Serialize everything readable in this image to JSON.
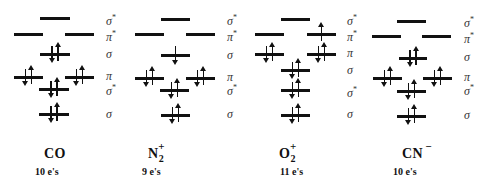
{
  "molecules": [
    {
      "name": "CO",
      "subscript": "",
      "charge": "",
      "electron_count": "10 e's",
      "orbital_labels": [
        {
          "symbol": "σ",
          "star": "*",
          "y": 12
        },
        {
          "symbol": "π",
          "star": "*",
          "y": 28
        },
        {
          "symbol": "σ",
          "star": "",
          "y": 48
        },
        {
          "symbol": "π",
          "star": "",
          "y": 70
        },
        {
          "symbol": "σ",
          "star": "*",
          "y": 82
        },
        {
          "symbol": "σ",
          "star": "",
          "y": 108
        }
      ],
      "levels": [
        {
          "orbital": "σ*",
          "x": 40,
          "y": 17,
          "w": 30,
          "electrons": 0
        },
        {
          "orbital": "π*",
          "x": 14,
          "y": 33,
          "w": 29,
          "electrons": 0
        },
        {
          "orbital": "π*",
          "x": 65,
          "y": 33,
          "w": 29,
          "electrons": 0
        },
        {
          "orbital": "σ",
          "x": 40,
          "y": 53,
          "w": 30,
          "electrons": 2
        },
        {
          "orbital": "π",
          "x": 14,
          "y": 76,
          "w": 29,
          "electrons": 2
        },
        {
          "orbital": "π",
          "x": 65,
          "y": 76,
          "w": 29,
          "electrons": 2
        },
        {
          "orbital": "σ*",
          "x": 39,
          "y": 88,
          "w": 30,
          "electrons": 2
        },
        {
          "orbital": "σ",
          "x": 39,
          "y": 113,
          "w": 30,
          "electrons": 2
        }
      ],
      "label_x": 106,
      "name_x": 44,
      "name_y": 146,
      "count_x": 35,
      "count_y": 166
    },
    {
      "name": "N",
      "subscript": "2",
      "charge": "+",
      "electron_count": "9 e's",
      "orbital_labels": [
        {
          "symbol": "σ",
          "star": "*",
          "y": 12
        },
        {
          "symbol": "π",
          "star": "*",
          "y": 28
        },
        {
          "symbol": "σ",
          "star": "",
          "y": 49
        },
        {
          "symbol": "π",
          "star": "",
          "y": 71
        },
        {
          "symbol": "σ",
          "star": "*",
          "y": 82
        },
        {
          "symbol": "σ",
          "star": "",
          "y": 108
        }
      ],
      "levels": [
        {
          "orbital": "σ*",
          "x": 161,
          "y": 18,
          "w": 29,
          "electrons": 0
        },
        {
          "orbital": "π*",
          "x": 135,
          "y": 33,
          "w": 29,
          "electrons": 0
        },
        {
          "orbital": "π*",
          "x": 186,
          "y": 33,
          "w": 29,
          "electrons": 0
        },
        {
          "orbital": "σ",
          "x": 161,
          "y": 54,
          "w": 29,
          "electrons": 1,
          "spin": "down"
        },
        {
          "orbital": "π",
          "x": 135,
          "y": 77,
          "w": 29,
          "electrons": 2
        },
        {
          "orbital": "π",
          "x": 186,
          "y": 77,
          "w": 29,
          "electrons": 2
        },
        {
          "orbital": "σ*",
          "x": 160,
          "y": 89,
          "w": 29,
          "electrons": 2
        },
        {
          "orbital": "σ",
          "x": 161,
          "y": 114,
          "w": 29,
          "electrons": 2
        }
      ],
      "label_x": 227,
      "name_x": 148,
      "name_y": 146,
      "count_x": 142,
      "count_y": 166
    },
    {
      "name": "O",
      "subscript": "2",
      "charge": "+",
      "electron_count": "11 e's",
      "orbital_labels": [
        {
          "symbol": "σ",
          "star": "*",
          "y": 12
        },
        {
          "symbol": "π",
          "star": "*",
          "y": 28
        },
        {
          "symbol": "π",
          "star": "",
          "y": 47
        },
        {
          "symbol": "σ",
          "star": "",
          "y": 64
        },
        {
          "symbol": "σ",
          "star": "*",
          "y": 84
        },
        {
          "symbol": "σ",
          "star": "",
          "y": 108
        }
      ],
      "levels": [
        {
          "orbital": "σ*",
          "x": 281,
          "y": 18,
          "w": 29,
          "electrons": 0
        },
        {
          "orbital": "π*",
          "x": 255,
          "y": 33,
          "w": 29,
          "electrons": 0
        },
        {
          "orbital": "π*",
          "x": 307,
          "y": 33,
          "w": 29,
          "electrons": 1,
          "spin": "up"
        },
        {
          "orbital": "π",
          "x": 255,
          "y": 53,
          "w": 29,
          "electrons": 2
        },
        {
          "orbital": "π",
          "x": 307,
          "y": 53,
          "w": 29,
          "electrons": 2
        },
        {
          "orbital": "σ",
          "x": 281,
          "y": 69,
          "w": 29,
          "electrons": 2
        },
        {
          "orbital": "σ*",
          "x": 281,
          "y": 89,
          "w": 29,
          "electrons": 2
        },
        {
          "orbital": "σ",
          "x": 281,
          "y": 114,
          "w": 29,
          "electrons": 2
        }
      ],
      "label_x": 347,
      "name_x": 279,
      "name_y": 146,
      "count_x": 280,
      "count_y": 166
    },
    {
      "name": "CN",
      "subscript": "",
      "charge": "−",
      "electron_count": "10 e's",
      "orbital_labels": [
        {
          "symbol": "σ",
          "star": "*",
          "y": 14
        },
        {
          "symbol": "π",
          "star": "*",
          "y": 30
        },
        {
          "symbol": "σ",
          "star": "",
          "y": 51
        },
        {
          "symbol": "π",
          "star": "",
          "y": 71
        },
        {
          "symbol": "σ",
          "star": "*",
          "y": 82
        },
        {
          "symbol": "σ",
          "star": "",
          "y": 109
        }
      ],
      "levels": [
        {
          "orbital": "σ*",
          "x": 397,
          "y": 20,
          "w": 29,
          "electrons": 0
        },
        {
          "orbital": "π*",
          "x": 372,
          "y": 35,
          "w": 29,
          "electrons": 0
        },
        {
          "orbital": "π*",
          "x": 422,
          "y": 35,
          "w": 29,
          "electrons": 0
        },
        {
          "orbital": "σ",
          "x": 399,
          "y": 57,
          "w": 28,
          "electrons": 2
        },
        {
          "orbital": "π",
          "x": 373,
          "y": 77,
          "w": 29,
          "electrons": 2
        },
        {
          "orbital": "π",
          "x": 423,
          "y": 77,
          "w": 29,
          "electrons": 2
        },
        {
          "orbital": "σ*",
          "x": 397,
          "y": 90,
          "w": 29,
          "electrons": 2
        },
        {
          "orbital": "σ",
          "x": 397,
          "y": 115,
          "w": 29,
          "electrons": 2
        }
      ],
      "label_x": 464,
      "name_x": 402,
      "name_y": 146,
      "count_x": 393,
      "count_y": 166
    }
  ]
}
